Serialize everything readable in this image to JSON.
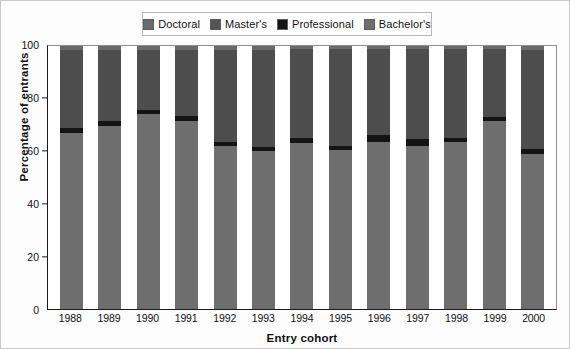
{
  "chart_data": {
    "type": "bar",
    "subtype": "stacked-percentage",
    "title": "",
    "xlabel": "Entry cohort",
    "ylabel": "Percentage of entrants",
    "ylim": [
      0,
      100
    ],
    "yticks": [
      0,
      20,
      40,
      60,
      80,
      100
    ],
    "grid": false,
    "legend_position": "top-center",
    "categories": [
      "1988",
      "1989",
      "1990",
      "1991",
      "1992",
      "1993",
      "1994",
      "1995",
      "1996",
      "1997",
      "1998",
      "1999",
      "2000"
    ],
    "stack_order_bottom_to_top": [
      "Bachelor's",
      "Professional",
      "Master's",
      "Doctoral"
    ],
    "series": [
      {
        "name": "Bachelor's",
        "color": "#6e6e6e",
        "values": [
          67.0,
          69.5,
          74.0,
          71.5,
          62.0,
          60.0,
          63.0,
          60.5,
          63.5,
          62.0,
          63.5,
          71.5,
          59.0
        ]
      },
      {
        "name": "Professional",
        "color": "#141414",
        "values": [
          2.0,
          2.0,
          1.5,
          2.0,
          1.5,
          1.5,
          2.0,
          1.5,
          2.5,
          2.5,
          1.5,
          1.5,
          2.0
        ]
      },
      {
        "name": "Master's",
        "color": "#4d4d4d",
        "values": [
          29.5,
          27.0,
          23.0,
          25.0,
          35.0,
          37.0,
          34.0,
          37.0,
          33.0,
          34.5,
          34.0,
          26.0,
          37.5
        ]
      },
      {
        "name": "Doctoral",
        "color": "#6a6a6a",
        "values": [
          1.5,
          1.5,
          1.5,
          1.5,
          1.5,
          1.5,
          1.0,
          1.0,
          1.0,
          1.0,
          1.0,
          1.0,
          1.5
        ]
      }
    ]
  },
  "legend": {
    "items": [
      {
        "label": "Doctoral",
        "color": "#6a6a6a"
      },
      {
        "label": "Master's",
        "color": "#555555"
      },
      {
        "label": "Professional",
        "color": "#141414"
      },
      {
        "label": "Bachelor's",
        "color": "#6e6e6e"
      }
    ]
  },
  "axes": {
    "y": {
      "label": "Percentage of entrants",
      "ticks": [
        "0",
        "20",
        "40",
        "60",
        "80",
        "100"
      ]
    },
    "x": {
      "label": "Entry cohort"
    }
  }
}
